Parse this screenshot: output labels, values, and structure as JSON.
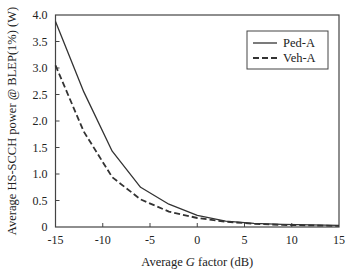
{
  "chart_data": {
    "type": "line",
    "title": "",
    "xlabel_parts": [
      {
        "text": "Average ",
        "italic": false
      },
      {
        "text": "G",
        "italic": true
      },
      {
        "text": " factor (dB)",
        "italic": false
      }
    ],
    "xlabel": "Average G factor (dB)",
    "ylabel": "Average HS-SCCH power @ BLEP(1%) (W)",
    "xlim": [
      -15,
      15
    ],
    "ylim": [
      0,
      4.0
    ],
    "xticks": [
      -15,
      -10,
      -5,
      0,
      5,
      10,
      15
    ],
    "xtick_labels": [
      "-15",
      "-10",
      "-5",
      "0",
      "5",
      "10",
      "15"
    ],
    "yticks": [
      0,
      0.5,
      1.0,
      1.5,
      2.0,
      2.5,
      3.0,
      3.5,
      4.0
    ],
    "ytick_labels": [
      "0",
      "0.5",
      "1.0",
      "1.5",
      "2.0",
      "2.5",
      "3.0",
      "3.5",
      "4.0"
    ],
    "grid": false,
    "legend_position": "top-right",
    "x": [
      -15,
      -12,
      -9,
      -6,
      -3,
      0,
      3,
      6,
      9,
      12,
      15
    ],
    "series": [
      {
        "name": "Ped-A",
        "style": "solid",
        "color": "#333333",
        "values": [
          3.88,
          2.55,
          1.43,
          0.75,
          0.43,
          0.22,
          0.11,
          0.07,
          0.05,
          0.04,
          0.03
        ]
      },
      {
        "name": "Veh-A",
        "style": "dashed",
        "color": "#333333",
        "values": [
          3.05,
          1.8,
          0.94,
          0.52,
          0.29,
          0.17,
          0.1,
          0.06,
          0.04,
          0.03,
          0.02
        ]
      }
    ]
  }
}
